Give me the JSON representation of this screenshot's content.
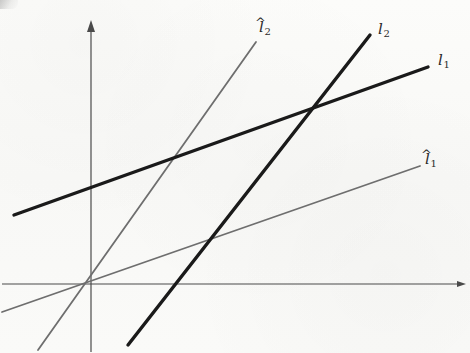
{
  "figure": {
    "width": 470,
    "height": 353,
    "background_color": "#fbfbf9"
  },
  "axes": {
    "origin": {
      "x": 91,
      "y": 284
    },
    "color": "#4a4a4a",
    "stroke_width": 1.2,
    "x_axis": {
      "name": "x-axis",
      "from": {
        "x": 2,
        "y": 284
      },
      "to": {
        "x": 466,
        "y": 284
      },
      "arrow": "right"
    },
    "y_axis": {
      "name": "y-axis",
      "from": {
        "x": 91,
        "y": 352
      },
      "to": {
        "x": 91,
        "y": 20
      },
      "arrow": "up"
    }
  },
  "lines": [
    {
      "id": "l1",
      "label": "l",
      "subscript": "1",
      "hat": false,
      "style": "dark-thick",
      "color": "#1a1a1a",
      "stroke_width": 3.4,
      "from": {
        "x": 14,
        "y": 215
      },
      "to": {
        "x": 428,
        "y": 67
      },
      "slope": -0.357,
      "label_pos": {
        "x": 437,
        "y": 57
      }
    },
    {
      "id": "l2",
      "label": "l",
      "subscript": "2",
      "hat": false,
      "style": "dark-thick",
      "color": "#1a1a1a",
      "stroke_width": 3.4,
      "from": {
        "x": 128,
        "y": 345
      },
      "to": {
        "x": 370,
        "y": 35
      },
      "slope": -1.281,
      "label_pos": {
        "x": 377,
        "y": 25
      }
    },
    {
      "id": "l1hat",
      "label": "l",
      "subscript": "1",
      "hat": true,
      "style": "gray-thin",
      "color": "#6e6e6e",
      "stroke_width": 1.8,
      "from": {
        "x": 2,
        "y": 312
      },
      "to": {
        "x": 420,
        "y": 166
      },
      "slope": -0.349,
      "label_pos": {
        "x": 424,
        "y": 156
      }
    },
    {
      "id": "l2hat",
      "label": "l",
      "subscript": "2",
      "hat": true,
      "style": "gray-thin",
      "color": "#6e6e6e",
      "stroke_width": 1.8,
      "from": {
        "x": 38,
        "y": 350
      },
      "to": {
        "x": 256,
        "y": 42
      },
      "slope": -1.413,
      "label_pos": {
        "x": 259,
        "y": 26
      }
    }
  ],
  "labels": {
    "l1": {
      "text": "l",
      "sub": "1",
      "hat": ""
    },
    "l2": {
      "text": "l",
      "sub": "2",
      "hat": ""
    },
    "l1hat": {
      "text": "l",
      "sub": "1",
      "hat": "^"
    },
    "l2hat": {
      "text": "l",
      "sub": "2",
      "hat": "^"
    }
  }
}
